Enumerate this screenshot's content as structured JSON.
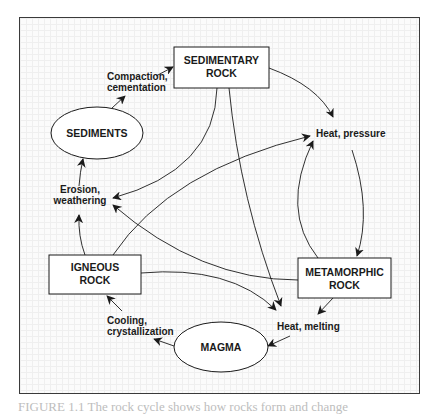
{
  "diagram": {
    "title": "Rock cycle",
    "nodes": {
      "sedimentary_rock": {
        "line1": "SEDIMENTARY",
        "line2": "ROCK",
        "shape": "rectangle"
      },
      "sediments": {
        "line1": "SEDIMENTS",
        "shape": "ellipse"
      },
      "igneous_rock": {
        "line1": "IGNEOUS",
        "line2": "ROCK",
        "shape": "rectangle"
      },
      "metamorphic_rock": {
        "line1": "METAMORPHIC",
        "line2": "ROCK",
        "shape": "rectangle"
      },
      "magma": {
        "line1": "MAGMA",
        "shape": "ellipse"
      }
    },
    "processes": {
      "compaction": {
        "line1": "Compaction,",
        "line2": "cementation"
      },
      "heat_pressure": {
        "line1": "Heat, pressure"
      },
      "erosion": {
        "line1": "Erosion,",
        "line2": "weathering"
      },
      "heat_melting": {
        "line1": "Heat, melting"
      },
      "cooling": {
        "line1": "Cooling,",
        "line2": "crystallization"
      }
    },
    "edges": [
      {
        "from": "sediments",
        "to": "compaction"
      },
      {
        "from": "compaction",
        "to": "sedimentary_rock"
      },
      {
        "from": "sedimentary_rock",
        "to": "heat_pressure"
      },
      {
        "from": "sedimentary_rock",
        "to": "erosion"
      },
      {
        "from": "sedimentary_rock",
        "to": "heat_melting"
      },
      {
        "from": "heat_pressure",
        "to": "metamorphic_rock"
      },
      {
        "from": "metamorphic_rock",
        "to": "heat_pressure"
      },
      {
        "from": "metamorphic_rock",
        "to": "erosion"
      },
      {
        "from": "metamorphic_rock",
        "to": "heat_melting"
      },
      {
        "from": "igneous_rock",
        "to": "erosion"
      },
      {
        "from": "igneous_rock",
        "to": "heat_pressure"
      },
      {
        "from": "igneous_rock",
        "to": "heat_melting"
      },
      {
        "from": "erosion",
        "to": "sediments"
      },
      {
        "from": "heat_melting",
        "to": "magma"
      },
      {
        "from": "magma",
        "to": "cooling"
      },
      {
        "from": "cooling",
        "to": "igneous_rock"
      }
    ],
    "colors": {
      "stroke": "#1a1a1a",
      "frame": "#3a3a3a",
      "grid": "#efefef"
    }
  },
  "caption": {
    "text": "FIGURE 1.1  The rock cycle shows how rocks form and change"
  }
}
